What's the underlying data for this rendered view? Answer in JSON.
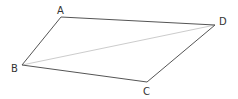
{
  "diagram": {
    "type": "quadrilateral",
    "vertices": [
      {
        "id": "A",
        "label": "A",
        "x": 61,
        "y": 17,
        "lx": 57,
        "ly": 14
      },
      {
        "id": "B",
        "label": "B",
        "x": 22,
        "y": 65,
        "lx": 11,
        "ly": 72
      },
      {
        "id": "C",
        "label": "C",
        "x": 147,
        "y": 82,
        "lx": 143,
        "ly": 95
      },
      {
        "id": "D",
        "label": "D",
        "x": 215,
        "y": 25,
        "lx": 219,
        "ly": 25
      }
    ],
    "edges": [
      {
        "from": "A",
        "to": "D",
        "style": "side"
      },
      {
        "from": "D",
        "to": "C",
        "style": "side"
      },
      {
        "from": "C",
        "to": "B",
        "style": "side"
      },
      {
        "from": "B",
        "to": "A",
        "style": "side"
      },
      {
        "from": "B",
        "to": "D",
        "style": "diagonal"
      }
    ],
    "colors": {
      "side": "#555555",
      "diagonal": "#cccccc",
      "label": "#333333"
    }
  }
}
